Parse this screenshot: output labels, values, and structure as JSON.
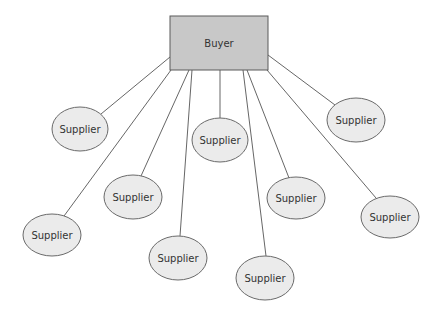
{
  "diagram": {
    "type": "hub-and-spoke",
    "hub": {
      "label": "Buyer",
      "x": 170,
      "y": 16,
      "w": 98,
      "h": 54
    },
    "nodes": [
      {
        "id": "s1",
        "label": "Supplier",
        "cx": 80,
        "cy": 129,
        "rx": 28,
        "ry": 22
      },
      {
        "id": "s2",
        "label": "Supplier",
        "cx": 220,
        "cy": 140,
        "rx": 28,
        "ry": 22
      },
      {
        "id": "s3",
        "label": "Supplier",
        "cx": 356,
        "cy": 120,
        "rx": 29,
        "ry": 22
      },
      {
        "id": "s4",
        "label": "Supplier",
        "cx": 133,
        "cy": 197,
        "rx": 29,
        "ry": 22
      },
      {
        "id": "s5",
        "label": "Supplier",
        "cx": 296,
        "cy": 198,
        "rx": 29,
        "ry": 21
      },
      {
        "id": "s6",
        "label": "Supplier",
        "cx": 52,
        "cy": 235,
        "rx": 29,
        "ry": 21
      },
      {
        "id": "s7",
        "label": "Supplier",
        "cx": 390,
        "cy": 217,
        "rx": 29,
        "ry": 21
      },
      {
        "id": "s8",
        "label": "Supplier",
        "cx": 178,
        "cy": 258,
        "rx": 29,
        "ry": 22
      },
      {
        "id": "s9",
        "label": "Supplier",
        "cx": 265,
        "cy": 278,
        "rx": 29,
        "ry": 22
      }
    ],
    "edges": [
      {
        "to": "s1",
        "x1": 170,
        "y1": 57,
        "x2": 101,
        "y2": 114
      },
      {
        "to": "s6",
        "x1": 171,
        "y1": 70,
        "x2": 64,
        "y2": 216
      },
      {
        "to": "s4",
        "x1": 189,
        "y1": 70,
        "x2": 141,
        "y2": 176
      },
      {
        "to": "s8",
        "x1": 192,
        "y1": 70,
        "x2": 180,
        "y2": 236
      },
      {
        "to": "s2",
        "x1": 220,
        "y1": 70,
        "x2": 220,
        "y2": 118
      },
      {
        "to": "s9",
        "x1": 243,
        "y1": 70,
        "x2": 266,
        "y2": 256
      },
      {
        "to": "s5",
        "x1": 247,
        "y1": 70,
        "x2": 289,
        "y2": 178
      },
      {
        "to": "s7",
        "x1": 267,
        "y1": 70,
        "x2": 376,
        "y2": 198
      },
      {
        "to": "s3",
        "x1": 268,
        "y1": 55,
        "x2": 335,
        "y2": 105
      }
    ]
  }
}
